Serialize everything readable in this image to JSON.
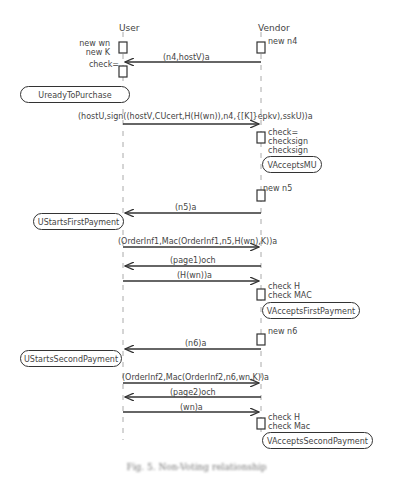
{
  "diagram": {
    "type": "sequence",
    "participants": [
      {
        "name": "User",
        "x": 123
      },
      {
        "name": "Vendor",
        "x": 261
      }
    ],
    "participant_labels": {
      "user": "User",
      "vendor": "Vendor"
    },
    "actions": {
      "user_init_1": "new wn",
      "user_init_2": "new K",
      "vendor_init": "new n4",
      "user_check": "check=",
      "vendor_checks_1": "check=",
      "vendor_checks_2": "checksign",
      "vendor_checks_3": "checksign",
      "vendor_new_n5": "new n5",
      "vendor_checks_first_1": "check H",
      "vendor_checks_first_2": "check MAC",
      "vendor_new_n6": "new n6",
      "vendor_checks_second_1": "check H",
      "vendor_checks_second_2": "check Mac"
    },
    "messages": [
      {
        "label": "(n4,hostV)a",
        "from": "Vendor",
        "to": "User"
      },
      {
        "label": "(hostU,sign((hostV,CUcert,H(H(wn)),n4,{[K]}epkv),sskU))a",
        "from": "User",
        "to": "Vendor"
      },
      {
        "label": "(n5)a",
        "from": "Vendor",
        "to": "User"
      },
      {
        "label": "(OrderInf1,Mac(OrderInf1,n5,H(wn),K))a",
        "from": "User",
        "to": "Vendor"
      },
      {
        "label": "(page1)och",
        "from": "Vendor",
        "to": "User"
      },
      {
        "label": "(H(wn))a",
        "from": "User",
        "to": "Vendor"
      },
      {
        "label": "(n6)a",
        "from": "Vendor",
        "to": "User"
      },
      {
        "label": "(OrderInf2,Mac(OrderInf2,n6,wn,K))a",
        "from": "User",
        "to": "Vendor"
      },
      {
        "label": "(page2)och",
        "from": "Vendor",
        "to": "User"
      },
      {
        "label": "(wn)a",
        "from": "User",
        "to": "Vendor"
      }
    ],
    "states": {
      "user_ready": "UreadyToPurchase",
      "vendor_accepts_mu": "VAcceptsMU",
      "user_starts_first": "UStartsFirstPayment",
      "vendor_accepts_first": "VAcceptsFirstPayment",
      "user_starts_second": "UStartsSecondPayment",
      "vendor_accepts_second": "VAcceptsSecondPayment"
    },
    "colors": {
      "line": "#333333",
      "lifeline": "#999999",
      "text": "#444444"
    }
  },
  "caption": "Fig. 5. Non-Voting relationship"
}
